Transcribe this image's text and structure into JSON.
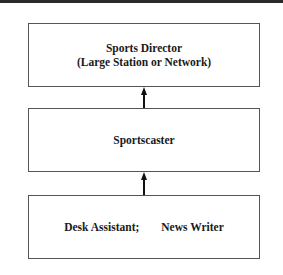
{
  "diagram": {
    "type": "career-ladder",
    "direction": "bottom-to-top",
    "nodes": [
      {
        "id": "sports-director",
        "line1": "Sports Director",
        "line2": "(Large Station or Network)"
      },
      {
        "id": "sportscaster",
        "label": "Sportscaster"
      },
      {
        "id": "entry",
        "label_a": "Desk Assistant;",
        "label_b": "News Writer"
      }
    ],
    "edges": [
      {
        "from": "entry",
        "to": "sportscaster"
      },
      {
        "from": "sportscaster",
        "to": "sports-director"
      }
    ]
  }
}
